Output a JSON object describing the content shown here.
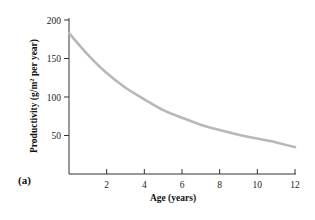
{
  "chart_data": {
    "type": "line",
    "title": "",
    "panel_label": "(a)",
    "xlabel": "Age (years)",
    "ylabel": "Productivity (g/m² per year)",
    "ylabel_parts": {
      "pre": "Productivity (g/m",
      "sup": "2",
      "post": " per year)"
    },
    "x_ticks": [
      2,
      4,
      6,
      8,
      10,
      12
    ],
    "y_ticks": [
      50,
      100,
      150,
      200
    ],
    "xlim": [
      0,
      12
    ],
    "ylim": [
      0,
      200
    ],
    "grid": false,
    "legend": null,
    "series": [
      {
        "name": "Productivity",
        "color": "#b8b8b8",
        "x": [
          0,
          1,
          2,
          3,
          4,
          5,
          6,
          7,
          8,
          9,
          10,
          11,
          12
        ],
        "values": [
          183,
          155,
          131,
          112,
          97,
          83,
          73,
          64,
          57,
          51,
          46,
          41,
          35
        ]
      }
    ]
  }
}
